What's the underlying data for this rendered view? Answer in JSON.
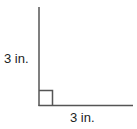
{
  "diagram": {
    "type": "right-angle",
    "vertical_side": {
      "label": "3 in.",
      "length": 3,
      "unit": "in."
    },
    "horizontal_side": {
      "label": "3 in.",
      "length": 3,
      "unit": "in."
    },
    "right_angle_marker": true,
    "line_color": "#555555"
  }
}
